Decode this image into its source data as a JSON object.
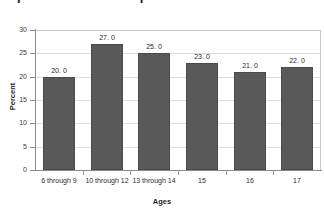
{
  "title": "important other social problems at school",
  "chart_data": {
    "type": "bar",
    "title": "important other social problems at school",
    "xlabel": "Ages",
    "ylabel": "Percent",
    "categories": [
      "6 through 9",
      "10 through 12",
      "13 through 14",
      "15",
      "16",
      "17"
    ],
    "values": [
      20.0,
      27.0,
      25.0,
      23.0,
      21.0,
      22.0
    ],
    "value_labels": [
      "20. 0",
      "27. 0",
      "25. 0",
      "23. 0",
      "21. 0",
      "22. 0"
    ],
    "ylim": [
      0,
      30
    ],
    "yticks": [
      0,
      5,
      10,
      15,
      20,
      25,
      30
    ],
    "ytick_labels": [
      "0",
      "5",
      "10",
      "15",
      "20",
      "25",
      "30"
    ],
    "grid": true,
    "legend": false,
    "bar_color": "#595959",
    "gridline_color": "#dedede",
    "axis_color": "#8a8a8a"
  }
}
